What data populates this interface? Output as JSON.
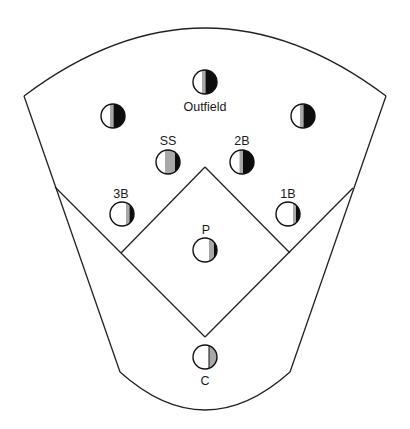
{
  "diagram": {
    "colors": {
      "line": "#222222",
      "white": "#ffffff",
      "gray": "#a8a8a8",
      "black": "#0d0d0d"
    },
    "field_outline": {
      "outer_left_top": [
        24,
        96
      ],
      "outer_right_top": [
        386,
        96
      ],
      "outer_arc_peak": [
        205,
        20
      ],
      "outer_left_bottom": [
        120,
        372
      ],
      "outer_right_bottom": [
        290,
        372
      ],
      "bottom_arc_low": [
        205,
        410
      ]
    },
    "infield": {
      "home": [
        205,
        337
      ],
      "second": [
        205,
        167
      ],
      "third": [
        121,
        253
      ],
      "first": [
        290,
        253
      ],
      "foul_left_end": [
        55,
        187
      ],
      "foul_right_end": [
        353,
        188
      ]
    },
    "players": [
      {
        "id": "cf",
        "label": "",
        "cx": 205,
        "cy": 82,
        "white_end": 0.38,
        "gray_end": 0.52
      },
      {
        "id": "lf",
        "label": "",
        "cx": 113,
        "cy": 116,
        "white_end": 0.38,
        "gray_end": 0.52
      },
      {
        "id": "rf",
        "label": "",
        "cx": 303,
        "cy": 116,
        "white_end": 0.38,
        "gray_end": 0.52
      },
      {
        "id": "ss",
        "label": "SS",
        "cx": 168,
        "cy": 162,
        "white_end": 0.38,
        "gray_end": 0.8
      },
      {
        "id": "2b",
        "label": "2B",
        "cx": 242,
        "cy": 162,
        "white_end": 0.4,
        "gray_end": 0.55
      },
      {
        "id": "3b",
        "label": "3B",
        "cx": 122,
        "cy": 214,
        "white_end": 0.66,
        "gray_end": 0.8
      },
      {
        "id": "1b",
        "label": "1B",
        "cx": 288,
        "cy": 214,
        "white_end": 0.7,
        "gray_end": 0.82
      },
      {
        "id": "p",
        "label": "P",
        "cx": 205,
        "cy": 250,
        "white_end": 0.66,
        "gray_end": 0.9
      },
      {
        "id": "c",
        "label": "C",
        "cx": 205,
        "cy": 357,
        "white_end": 0.66,
        "gray_end": 1.0
      }
    ],
    "labels": {
      "outfield": "Outfield",
      "ss": "SS",
      "second_base": "2B",
      "third_base": "3B",
      "first_base": "1B",
      "pitcher": "P",
      "catcher": "C"
    }
  }
}
